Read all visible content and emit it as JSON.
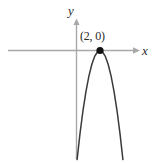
{
  "figure": {
    "kind": "coordinate-plane-graph",
    "background_color": "#ffffff",
    "axis_color": "#a8a8a8",
    "curve_color": "#3a3a3a",
    "point_color": "#111111",
    "text_color": "#2b2b2b",
    "x_axis_label": "x",
    "y_axis_label": "y",
    "vertex_label": "(2, 0)"
  },
  "chart_data": {
    "type": "line",
    "title": "",
    "xlabel": "x",
    "ylabel": "y",
    "grid": false,
    "legend": null,
    "annotations": [
      {
        "text": "(2, 0)",
        "x": 2,
        "y": 0,
        "marker": "filled-circle",
        "position": "above"
      }
    ],
    "axis_arrows": {
      "x_positive": true,
      "y_positive": true
    },
    "xlim": [
      -3.4,
      4.6
    ],
    "ylim": [
      -9.5,
      1.5
    ],
    "series": [
      {
        "name": "downward parabola with vertex (2, 0)",
        "equation": "y = -(x - 2)^2",
        "x": [
          0.05,
          0.3,
          0.55,
          0.8,
          1.05,
          1.3,
          1.55,
          1.8,
          2.0,
          2.2,
          2.45,
          2.7,
          2.95,
          3.2,
          3.45,
          3.7,
          3.95
        ],
        "values": [
          -3.8,
          -2.89,
          -2.1,
          -1.44,
          -0.9,
          -0.49,
          -0.2,
          -0.04,
          0,
          -0.04,
          -0.2,
          -0.49,
          -0.9,
          -1.44,
          -2.1,
          -2.89,
          -3.8
        ]
      }
    ]
  }
}
